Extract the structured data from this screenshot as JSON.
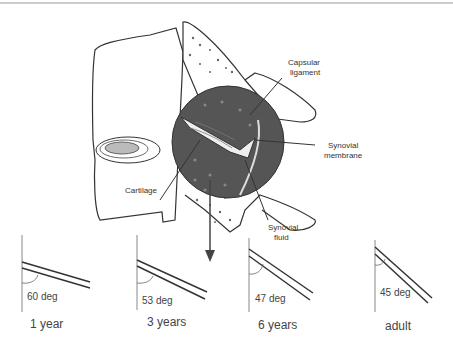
{
  "diagram": {
    "labels": {
      "capsular_ligament": [
        "Capsular",
        "ligament"
      ],
      "synovial_membrane": [
        "Synovial",
        "membrane"
      ],
      "cartilage": "Cartilage",
      "synovial_fluid": [
        "Synovial",
        "fluid"
      ]
    },
    "angles": [
      {
        "angle": "60 deg",
        "age": "1 year",
        "degrees": 60
      },
      {
        "angle": "53 deg",
        "age": "3 years",
        "degrees": 53
      },
      {
        "angle": "47 deg",
        "age": "6 years",
        "degrees": 47
      },
      {
        "angle": "45 deg",
        "age": "adult",
        "degrees": 45
      }
    ],
    "colors": {
      "line": "#333333",
      "joint_fill": "#555555",
      "disc_fill": "#bbbbbb"
    }
  }
}
